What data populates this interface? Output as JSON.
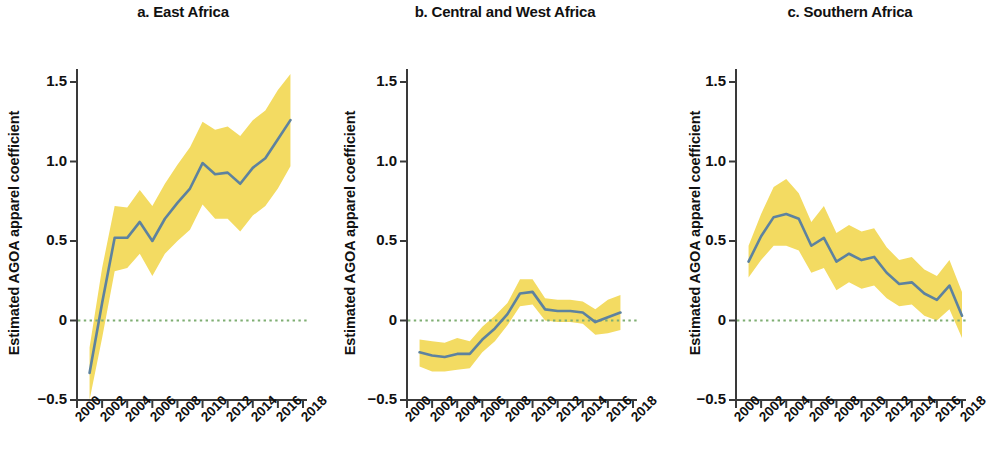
{
  "figure": {
    "ylabel": "Estimated AGOA apparel  coefficient",
    "background": "#ffffff"
  },
  "style": {
    "line_color": "#5d829f",
    "band_color": "#f3db62",
    "zero_line_color": "#7fae73",
    "axis_color": "#3a3a3a",
    "text_color": "#111111"
  },
  "axes": {
    "ylim": [
      -0.5,
      1.5
    ],
    "yticks": [
      -0.5,
      0,
      0.5,
      1.0,
      1.5
    ],
    "ytick_labels": [
      "−0.5",
      "0",
      "0.5",
      "1.0",
      "1.5"
    ],
    "xlim": [
      2000,
      2018
    ],
    "xticks": [
      2000,
      2002,
      2004,
      2006,
      2008,
      2010,
      2012,
      2014,
      2016,
      2018
    ],
    "xtick_labels": [
      "2000",
      "2002",
      "2004",
      "2006",
      "2008",
      "2010",
      "2012",
      "2014",
      "2016",
      "2018"
    ],
    "grid": false,
    "zero_reference": 0
  },
  "chart_data": [
    {
      "type": "line",
      "panel": "a",
      "title": "a. East Africa",
      "xlabel": "",
      "ylabel": "Estimated AGOA apparel  coefficient",
      "xlim": [
        2000,
        2018
      ],
      "ylim": [
        -0.5,
        1.5
      ],
      "x": [
        2001,
        2002,
        2003,
        2004,
        2005,
        2006,
        2007,
        2008,
        2009,
        2010,
        2011,
        2012,
        2013,
        2014,
        2015,
        2016,
        2017
      ],
      "series": [
        {
          "name": "Estimated AGOA apparel coefficient",
          "values": [
            -0.33,
            0.11,
            0.52,
            0.52,
            0.62,
            0.5,
            0.64,
            0.74,
            0.83,
            0.99,
            0.92,
            0.93,
            0.86,
            0.96,
            1.02,
            1.14,
            1.26
          ]
        },
        {
          "name": "Confidence interval upper",
          "values": [
            -0.17,
            0.33,
            0.72,
            0.71,
            0.82,
            0.72,
            0.86,
            0.98,
            1.09,
            1.25,
            1.2,
            1.22,
            1.16,
            1.26,
            1.32,
            1.45,
            1.55
          ]
        },
        {
          "name": "Confidence interval lower",
          "values": [
            -0.5,
            -0.11,
            0.31,
            0.33,
            0.42,
            0.28,
            0.42,
            0.5,
            0.57,
            0.73,
            0.64,
            0.64,
            0.56,
            0.66,
            0.72,
            0.83,
            0.97
          ]
        }
      ]
    },
    {
      "type": "line",
      "panel": "b",
      "title": "b. Central and West Africa",
      "xlabel": "",
      "ylabel": "Estimated AGOA apparel coefficient",
      "xlim": [
        2000,
        2018
      ],
      "ylim": [
        -0.5,
        1.5
      ],
      "x": [
        2001,
        2002,
        2003,
        2004,
        2005,
        2006,
        2007,
        2008,
        2009,
        2010,
        2011,
        2012,
        2013,
        2014,
        2015,
        2016,
        2017
      ],
      "series": [
        {
          "name": "Estimated AGOA apparel coefficient",
          "values": [
            -0.2,
            -0.22,
            -0.23,
            -0.21,
            -0.21,
            -0.12,
            -0.05,
            0.04,
            0.17,
            0.18,
            0.07,
            0.06,
            0.06,
            0.05,
            -0.01,
            0.02,
            0.05
          ]
        },
        {
          "name": "Confidence interval upper",
          "values": [
            -0.12,
            -0.13,
            -0.14,
            -0.11,
            -0.13,
            -0.04,
            0.03,
            0.11,
            0.26,
            0.26,
            0.14,
            0.13,
            0.13,
            0.12,
            0.07,
            0.13,
            0.16
          ]
        },
        {
          "name": "Confidence interval lower",
          "values": [
            -0.29,
            -0.32,
            -0.32,
            -0.31,
            -0.3,
            -0.2,
            -0.13,
            -0.03,
            0.09,
            0.1,
            0.0,
            -0.01,
            -0.01,
            -0.02,
            -0.09,
            -0.08,
            -0.06
          ]
        }
      ]
    },
    {
      "type": "line",
      "panel": "c",
      "title": "c. Southern Africa",
      "xlabel": "",
      "ylabel": "Estimated AGOA apparel  coefficient",
      "xlim": [
        2000,
        2018
      ],
      "ylim": [
        -0.5,
        1.5
      ],
      "x": [
        2001,
        2002,
        2003,
        2004,
        2005,
        2006,
        2007,
        2008,
        2009,
        2010,
        2011,
        2012,
        2013,
        2014,
        2015,
        2016,
        2017
      ],
      "series": [
        {
          "name": "Estimated AGOA apparel coefficient",
          "values": [
            0.37,
            0.53,
            0.65,
            0.67,
            0.64,
            0.47,
            0.52,
            0.37,
            0.42,
            0.38,
            0.4,
            0.3,
            0.23,
            0.24,
            0.17,
            0.13,
            0.22,
            0.03
          ]
        },
        {
          "name": "Confidence interval upper",
          "values": [
            0.47,
            0.67,
            0.84,
            0.89,
            0.8,
            0.62,
            0.72,
            0.55,
            0.6,
            0.56,
            0.58,
            0.46,
            0.38,
            0.4,
            0.32,
            0.28,
            0.38,
            0.18
          ]
        },
        {
          "name": "Confidence interval lower",
          "values": [
            0.27,
            0.38,
            0.47,
            0.47,
            0.44,
            0.3,
            0.33,
            0.19,
            0.24,
            0.2,
            0.22,
            0.14,
            0.09,
            0.1,
            0.03,
            0.0,
            0.07,
            -0.11
          ]
        }
      ]
    }
  ]
}
